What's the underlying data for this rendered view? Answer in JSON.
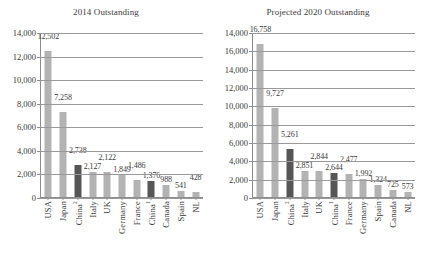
{
  "chart_data": [
    {
      "type": "bar",
      "title": "2014 Outstanding",
      "xlabel": "",
      "ylabel": "",
      "ylim": [
        0,
        14000
      ],
      "yticks": [
        "0",
        "2,000",
        "4,000",
        "6,000",
        "8,000",
        "10,000",
        "12,000",
        "14,000"
      ],
      "ytick_values": [
        0,
        2000,
        4000,
        6000,
        8000,
        10000,
        12000,
        14000
      ],
      "grid": true,
      "legend": "none",
      "categories": [
        "USA",
        "Japan",
        "China",
        "Italy",
        "UK",
        "Germany",
        "France",
        "China",
        "Canada",
        "Spain",
        "NL"
      ],
      "category_superscripts": [
        "",
        "",
        "2",
        "",
        "",
        "",
        "",
        "1",
        "",
        "",
        ""
      ],
      "values": [
        12502,
        7258,
        2738,
        2127,
        2122,
        1849,
        1486,
        1376,
        988,
        541,
        428
      ],
      "value_labels": [
        "12,502",
        "7,258",
        "2,738",
        "2,127",
        "2,122",
        "1,849",
        "1,486",
        "1,376",
        "988",
        "541",
        "428"
      ],
      "highlighted": [
        false,
        false,
        true,
        false,
        false,
        false,
        false,
        true,
        false,
        false,
        false
      ],
      "label_rows": [
        0,
        0,
        0,
        1,
        0,
        1,
        0,
        1,
        1,
        1,
        0
      ],
      "colors": {
        "bar": "#b3b3b3",
        "bar_highlight": "#565656"
      }
    },
    {
      "type": "bar",
      "title": "Projected 2020 Outstanding",
      "xlabel": "",
      "ylabel": "",
      "ylim": [
        0,
        18000
      ],
      "yticks": [
        "0",
        "2,000",
        "4,000",
        "6,000",
        "8,000",
        "10,000",
        "12,000",
        "14,000",
        "16,000",
        "14,000"
      ],
      "ytick_values": [
        0,
        2000,
        4000,
        6000,
        8000,
        10000,
        12000,
        14000,
        16000,
        18000
      ],
      "grid": true,
      "legend": "none",
      "categories": [
        "USA",
        "Japan",
        "China",
        "Italy",
        "UK",
        "China",
        "France",
        "Germany",
        "Spain",
        "Canada",
        "NL"
      ],
      "category_superscripts": [
        "",
        "",
        "2",
        "",
        "",
        "1",
        "",
        "",
        "",
        "",
        ""
      ],
      "values": [
        16758,
        9727,
        5261,
        2851,
        2844,
        2644,
        2477,
        1992,
        1324,
        725,
        573
      ],
      "value_labels": [
        "16,758",
        "9,727",
        "5,261",
        "2,851",
        "2,844",
        "2,644",
        "2,477",
        "1,992",
        "1,324",
        "725",
        "573"
      ],
      "highlighted": [
        false,
        false,
        true,
        false,
        false,
        true,
        false,
        false,
        false,
        false,
        false
      ],
      "label_rows": [
        0,
        0,
        0,
        1,
        0,
        1,
        0,
        1,
        1,
        1,
        1
      ],
      "colors": {
        "bar": "#b3b3b3",
        "bar_highlight": "#565656"
      }
    }
  ]
}
